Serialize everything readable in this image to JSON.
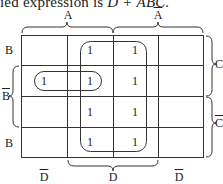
{
  "caption": {
    "prefix": "ied expression is ",
    "expression": "D + ĀBC."
  },
  "kmap": {
    "columns": [
      "A D̄",
      "A D",
      "Ā D",
      "Ā D̄"
    ],
    "rows": [
      "B C",
      "B̄ C",
      "B̄ C̄",
      "B C̄"
    ],
    "cells": [
      [
        0,
        1,
        1,
        0
      ],
      [
        1,
        1,
        1,
        0
      ],
      [
        0,
        1,
        1,
        0
      ],
      [
        0,
        1,
        1,
        0
      ]
    ],
    "cell_value": "1",
    "groups": [
      {
        "name": "D",
        "cells": "column D (cols 2-3, all rows)"
      },
      {
        "name": "ĀBC",
        "cells": "row B̄C, cols 1-2"
      }
    ]
  },
  "labels": {
    "top": {
      "A": "A",
      "A_bar": "A"
    },
    "left": {
      "B_top": "B",
      "B_bar": "B",
      "B_bottom": "B"
    },
    "right": {
      "C": "C",
      "C_bar": "C"
    },
    "bottom": {
      "D_bar_left": "D",
      "D": "D",
      "D_bar_right": "D"
    }
  }
}
